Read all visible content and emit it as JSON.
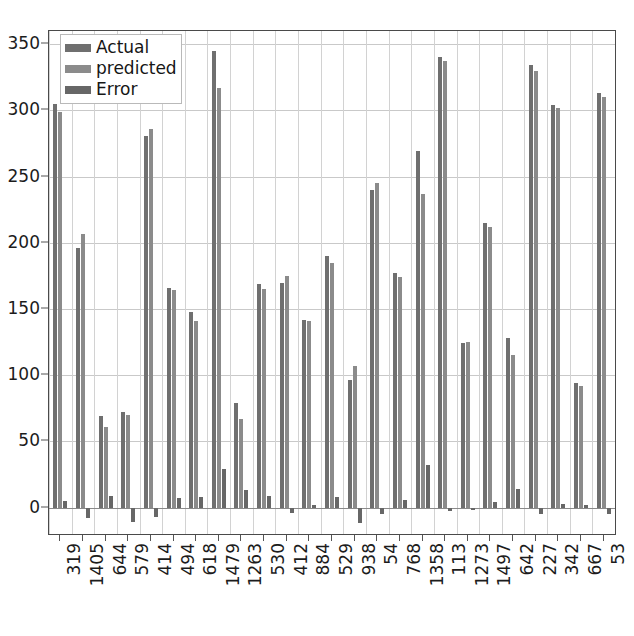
{
  "chart_data": {
    "type": "bar",
    "title": "",
    "xlabel": "",
    "ylabel": "",
    "ylim": [
      -20,
      360
    ],
    "yticks": [
      0,
      50,
      100,
      150,
      200,
      250,
      300,
      350
    ],
    "grid": true,
    "legend_position": "upper-left",
    "categories": [
      "319",
      "1405",
      "644",
      "579",
      "414",
      "494",
      "618",
      "1479",
      "1263",
      "530",
      "412",
      "884",
      "529",
      "938",
      "54",
      "768",
      "1358",
      "113",
      "1273",
      "1497",
      "642",
      "227",
      "342",
      "667",
      "53"
    ],
    "series": [
      {
        "name": "Actual",
        "color": "#6f6f6f",
        "values": [
          305,
          196,
          69,
          72,
          281,
          166,
          148,
          345,
          79,
          169,
          170,
          142,
          190,
          96,
          240,
          177,
          269,
          340,
          124,
          215,
          128,
          334,
          304,
          94,
          313
        ]
      },
      {
        "name": "predicted",
        "color": "#8b8b8b",
        "values": [
          299,
          207,
          61,
          70,
          286,
          164,
          141,
          317,
          67,
          165,
          175,
          141,
          185,
          107,
          245,
          174,
          237,
          337,
          125,
          212,
          115,
          330,
          302,
          92,
          310
        ]
      },
      {
        "name": "Error",
        "color": "#676767",
        "values": [
          5,
          -8,
          9,
          -11,
          -7,
          7,
          8,
          29,
          13,
          9,
          -4,
          2,
          8,
          -12,
          -5,
          6,
          32,
          -3,
          -2,
          4,
          14,
          -5,
          3,
          2,
          -5
        ]
      }
    ]
  },
  "legend": {
    "items": [
      {
        "label": "Actual"
      },
      {
        "label": "predicted"
      },
      {
        "label": "Error"
      }
    ]
  }
}
